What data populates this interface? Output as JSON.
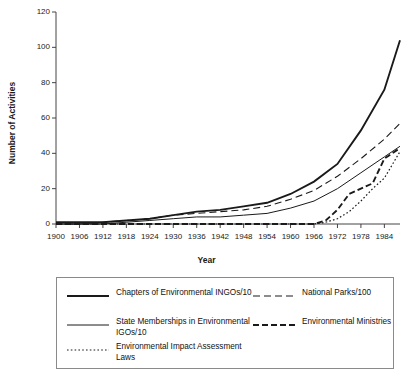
{
  "chart_data": {
    "type": "line",
    "title": "",
    "xlabel": "Year",
    "ylabel": "Number of Activities",
    "xlim": [
      1900,
      1988
    ],
    "ylim": [
      0,
      120
    ],
    "yticks": [
      0,
      20,
      40,
      60,
      80,
      100,
      120
    ],
    "xticks": [
      1900,
      1906,
      1912,
      1918,
      1924,
      1930,
      1936,
      1942,
      1948,
      1954,
      1960,
      1966,
      1972,
      1978,
      1984
    ],
    "grid": false,
    "legend_position": "bottom",
    "series": [
      {
        "name": "Chapters of Environmental INGOs/10",
        "style": "solid-thick",
        "x": [
          1900,
          1906,
          1912,
          1918,
          1924,
          1930,
          1936,
          1942,
          1948,
          1954,
          1960,
          1966,
          1972,
          1978,
          1984,
          1988
        ],
        "values": [
          1,
          1,
          1,
          2,
          3,
          5,
          7,
          8,
          10,
          12,
          17,
          24,
          34,
          53,
          76,
          104
        ]
      },
      {
        "name": "State Memberships in Environmental IGOs/10",
        "style": "solid-thin",
        "x": [
          1900,
          1906,
          1912,
          1918,
          1924,
          1930,
          1936,
          1942,
          1948,
          1954,
          1960,
          1966,
          1972,
          1978,
          1984,
          1988
        ],
        "values": [
          0,
          0,
          0,
          1,
          2,
          3,
          4,
          4,
          5,
          6,
          9,
          13,
          20,
          29,
          38,
          44
        ]
      },
      {
        "name": "National Parks/100",
        "style": "dashed-long",
        "x": [
          1900,
          1906,
          1912,
          1918,
          1924,
          1930,
          1936,
          1942,
          1948,
          1954,
          1960,
          1966,
          1972,
          1978,
          1984,
          1988
        ],
        "values": [
          0,
          0,
          1,
          2,
          3,
          5,
          6,
          7,
          8,
          10,
          14,
          19,
          27,
          37,
          48,
          57
        ]
      },
      {
        "name": "Environmental Impact Assessment Laws",
        "style": "dotted",
        "x": [
          1900,
          1966,
          1969,
          1972,
          1975,
          1978,
          1981,
          1984,
          1988
        ],
        "values": [
          0,
          0,
          1,
          3,
          7,
          13,
          20,
          26,
          41
        ]
      },
      {
        "name": "Environmental Ministries",
        "style": "dashed-short-thick",
        "x": [
          1900,
          1966,
          1969,
          1972,
          1975,
          1978,
          1981,
          1984,
          1988
        ],
        "values": [
          0,
          0,
          2,
          8,
          17,
          20,
          23,
          37,
          43
        ]
      }
    ]
  },
  "axes": {
    "y_title": "Number of Activities",
    "x_title": "Year",
    "y_tick_labels": [
      "0",
      "20",
      "40",
      "60",
      "80",
      "100",
      "120"
    ],
    "x_tick_labels": [
      "1900",
      "1906",
      "1912",
      "1918",
      "1924",
      "1930",
      "1936",
      "1942",
      "1948",
      "1954",
      "1960",
      "1966",
      "1972",
      "1978",
      "1984"
    ]
  },
  "legend": {
    "items": [
      {
        "label": "Chapters of Environmental INGOs/10",
        "style": "solid-thick"
      },
      {
        "label": "National Parks/100",
        "style": "dashed-long"
      },
      {
        "label": "State Memberships in Environmental IGOs/10",
        "style": "solid-thin"
      },
      {
        "label": "Environmental Ministries",
        "style": "dashed-short-thick"
      },
      {
        "label": "Environmental Impact Assessment Laws",
        "style": "dotted"
      }
    ]
  },
  "colors": {
    "line": "#1a1a1a",
    "axis": "#444444",
    "background": "#ffffff",
    "legend_border": "#8a8a8a"
  }
}
